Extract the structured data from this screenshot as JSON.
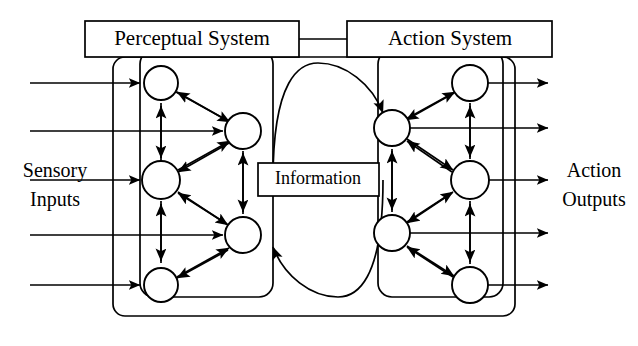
{
  "diagram": {
    "boxes": [
      {
        "id": "perceptual-system",
        "label": "Perceptual System",
        "x": 85,
        "y": 21,
        "w": 214,
        "h": 36,
        "font_size": 21
      },
      {
        "id": "action-system",
        "label": "Action System",
        "x": 347,
        "y": 21,
        "w": 205,
        "h": 36,
        "font_size": 21
      },
      {
        "id": "information",
        "label": "Information",
        "x": 258,
        "y": 163,
        "w": 121,
        "h": 33,
        "font_size": 18
      }
    ],
    "side_labels": [
      {
        "id": "sensory-inputs",
        "line1": "Sensory",
        "line2": "Inputs",
        "x": 55,
        "y1": 172,
        "y2": 201,
        "font_size": 20
      },
      {
        "id": "action-outputs",
        "line1": "Action",
        "line2": "Outputs",
        "x": 594,
        "y1": 172,
        "y2": 201,
        "font_size": 20
      }
    ],
    "outer_frame": {
      "x": 113,
      "y": 57,
      "w": 402,
      "h": 259,
      "rx": 12
    },
    "system_frames": [
      {
        "id": "perceptual-frame",
        "x": 140,
        "y": 57,
        "w": 133,
        "h": 240,
        "rx": 14
      },
      {
        "id": "action-frame",
        "x": 378,
        "y": 57,
        "w": 125,
        "h": 240,
        "rx": 14
      }
    ],
    "nodes": [
      {
        "id": "p-outer-1",
        "cx": 161,
        "cy": 83,
        "r": 17,
        "side": "perceptual",
        "column": "outer"
      },
      {
        "id": "p-outer-2",
        "cx": 161,
        "cy": 180,
        "r": 19,
        "side": "perceptual",
        "column": "outer"
      },
      {
        "id": "p-outer-3",
        "cx": 161,
        "cy": 285,
        "r": 17,
        "side": "perceptual",
        "column": "outer"
      },
      {
        "id": "p-inner-1",
        "cx": 243,
        "cy": 131,
        "r": 18,
        "side": "perceptual",
        "column": "inner"
      },
      {
        "id": "p-inner-2",
        "cx": 243,
        "cy": 235,
        "r": 18,
        "side": "perceptual",
        "column": "inner"
      },
      {
        "id": "a-inner-1",
        "cx": 392,
        "cy": 128,
        "r": 18,
        "side": "action",
        "column": "inner"
      },
      {
        "id": "a-inner-2",
        "cx": 392,
        "cy": 233,
        "r": 18,
        "side": "action",
        "column": "inner"
      },
      {
        "id": "a-outer-1",
        "cx": 470,
        "cy": 83,
        "r": 18,
        "side": "action",
        "column": "outer"
      },
      {
        "id": "a-outer-2",
        "cx": 470,
        "cy": 180,
        "r": 19,
        "side": "action",
        "column": "outer"
      },
      {
        "id": "a-outer-3",
        "cx": 470,
        "cy": 285,
        "r": 18,
        "side": "action",
        "column": "outer"
      }
    ],
    "input_rows": [
      {
        "id": "sensory-input-1",
        "y": 83,
        "x_start": 30,
        "x_end": 140,
        "arrow": true
      },
      {
        "id": "sensory-input-2",
        "y": 131,
        "x_start": 30,
        "x_end": 222,
        "arrow": true
      },
      {
        "id": "sensory-input-3",
        "y": 180,
        "x_start": 30,
        "x_end": 139,
        "arrow": true
      },
      {
        "id": "sensory-input-4",
        "y": 235,
        "x_start": 30,
        "x_end": 222,
        "arrow": true
      },
      {
        "id": "sensory-input-5",
        "y": 285,
        "x_start": 30,
        "x_end": 140,
        "arrow": true
      }
    ],
    "output_rows": [
      {
        "id": "action-output-1",
        "y": 83,
        "x_start": 488,
        "x_end": 545,
        "arrow": true
      },
      {
        "id": "action-output-2",
        "y": 128,
        "x_start": 410,
        "x_end": 545,
        "arrow": true
      },
      {
        "id": "action-output-3",
        "y": 180,
        "x_start": 489,
        "x_end": 545,
        "arrow": true
      },
      {
        "id": "action-output-4",
        "y": 233,
        "x_start": 410,
        "x_end": 545,
        "arrow": true
      },
      {
        "id": "action-output-5",
        "y": 285,
        "x_start": 488,
        "x_end": 545,
        "arrow": true
      }
    ],
    "connector": {
      "id": "system-link",
      "x1": 299,
      "x2": 347,
      "y": 39
    },
    "information_arcs": [
      {
        "id": "arc-perception-to-action",
        "direction": "right",
        "from": "perceptual",
        "to": "action"
      },
      {
        "id": "arc-action-to-perception",
        "direction": "left",
        "from": "action",
        "to": "perceptual"
      }
    ],
    "colors": {
      "stroke": "#000000",
      "fill": "#ffffff",
      "background": "#ffffff"
    }
  }
}
